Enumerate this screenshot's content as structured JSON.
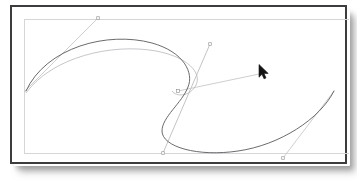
{
  "application": {
    "type": "vector-graphics-editor",
    "window_title": "",
    "canvas_background": "#ffffff",
    "frame_border_color": "#3c3c3e",
    "artboard_boundary_color": "#d6d6d8"
  },
  "canvas": {
    "artboard": {
      "x": 12,
      "y": 12,
      "width": 329,
      "height": 140,
      "stroke": "#d6d6d8"
    },
    "paths": [
      {
        "name": "primary-bezier-path",
        "stroke": "#5a5a5e",
        "stroke_width": 0.9,
        "fill": "none",
        "d": "M 14 84 C 34 40, 96 24, 140 36 C 172 45, 182 66, 176 80 C 170 96, 150 110, 150 124 C 150 140, 186 150, 226 144 C 268 138, 308 112, 322 84"
      },
      {
        "name": "secondary-preview-path",
        "stroke": "#b8b8bc",
        "stroke_width": 0.8,
        "fill": "none",
        "d": "M 14 86 C 40 50, 100 36, 144 44 C 176 50, 190 66, 184 78 C 178 90, 164 90, 160 84"
      }
    ],
    "handle_lines": [
      {
        "name": "handle-line-upper-left",
        "stroke": "#c2c2c6",
        "stroke_width": 0.8,
        "x1": 12,
        "y1": 85,
        "x2": 86,
        "y2": 11
      },
      {
        "name": "handle-line-through-anchor",
        "stroke": "#b4b4b8",
        "stroke_width": 0.8,
        "x1": 198,
        "y1": 37,
        "x2": 151,
        "y2": 146
      },
      {
        "name": "handle-line-to-cursor",
        "stroke": "#c2c2c6",
        "stroke_width": 0.8,
        "x1": 166,
        "y1": 84,
        "x2": 252,
        "y2": 66
      },
      {
        "name": "handle-line-lower-right",
        "stroke": "#c2c2c6",
        "stroke_width": 0.8,
        "x1": 271,
        "y1": 151,
        "x2": 322,
        "y2": 84
      }
    ],
    "control_points": [
      {
        "name": "control-point-upper-left",
        "x": 86,
        "y": 11,
        "stroke": "#9a9a9e"
      },
      {
        "name": "control-point-upper-right",
        "x": 198,
        "y": 37,
        "stroke": "#9a9a9e"
      },
      {
        "name": "control-point-lower-left",
        "x": 151,
        "y": 146,
        "stroke": "#9a9a9e"
      },
      {
        "name": "control-point-lower-right",
        "x": 271,
        "y": 151,
        "stroke": "#9a9a9e"
      },
      {
        "name": "anchor-point-selected",
        "x": 166,
        "y": 84,
        "stroke": "#9a9a9e"
      }
    ]
  },
  "cursor": {
    "name": "arrow-pointer",
    "x": 258,
    "y": 64,
    "color": "#141414"
  }
}
